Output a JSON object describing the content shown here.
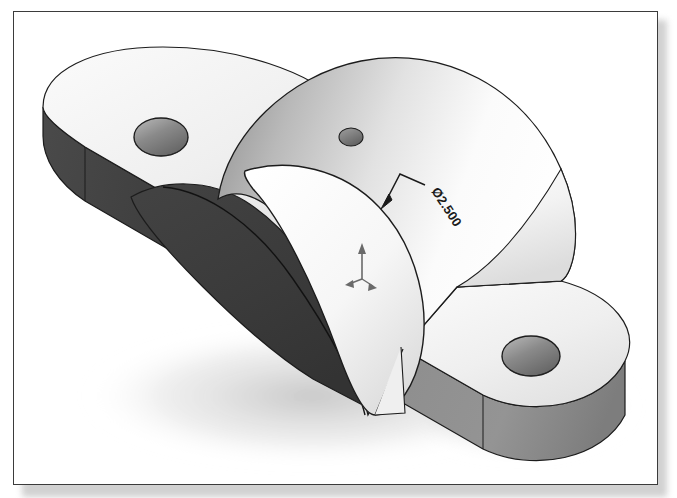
{
  "page": {
    "background_color": "#ffffff",
    "frame_border_color": "#3b3b3b",
    "shadow_color": "#c9c9c9"
  },
  "model": {
    "name": "bearing-block",
    "view": "isometric",
    "render_style": "shaded-with-edges",
    "edge_color": "#1a1a1a",
    "colors": {
      "face_light": "#f2f2f2",
      "face_white": "#ffffff",
      "face_mid_gray": "#9b9b9b",
      "face_dark_gray": "#6f6f6f",
      "bore_shadow": "#3a3a3a",
      "hole_dark": "#5f5f5f",
      "hole_light": "#b8b8b8"
    },
    "features": [
      {
        "id": "left-mount-pad",
        "label": "Left Mounting Pad",
        "has_hole": true
      },
      {
        "id": "right-mount-pad",
        "label": "Right Mounting Pad",
        "has_hole": true
      },
      {
        "id": "cylinder-boss",
        "label": "Cylindrical Boss",
        "has_hole": false
      },
      {
        "id": "main-bore",
        "label": "Main Bore",
        "has_hole": true
      },
      {
        "id": "oil-hole",
        "label": "Oil Hole",
        "has_hole": true
      }
    ]
  },
  "annotations": {
    "dimension": {
      "name": "bore-diameter",
      "symbol": "Ø",
      "value": "2.500",
      "text": "Ø2.500",
      "rotation_deg": 57,
      "leader": {
        "arrow_x": 385,
        "arrow_y": 205,
        "vertex_x": 400,
        "vertex_y": 176,
        "end_x": 425,
        "end_y": 187
      }
    },
    "origin_marker": {
      "name": "origin-triad",
      "x": 349,
      "y": 268,
      "color": "#6a6a6a"
    }
  }
}
